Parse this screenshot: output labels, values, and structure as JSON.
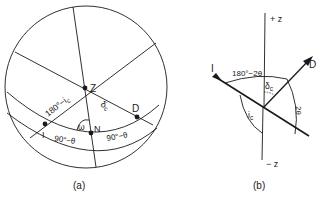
{
  "panel_a": {
    "caption": "(a)",
    "points": {
      "Z": "Z",
      "D": "D",
      "N": "N",
      "I": "I"
    },
    "labels": {
      "arc_IZ": "180°−i",
      "arc_IZ_sub": "c",
      "arc_ZD": "δ",
      "arc_ZD_sub": "c",
      "angle_N": "ω",
      "arc_IN": "90°−θ",
      "arc_ND": "90°−θ"
    }
  },
  "panel_b": {
    "caption": "(b)",
    "axis_top": "+ z",
    "axis_bottom": "− z",
    "ray_incident": "I",
    "ray_diffracted": "D",
    "labels": {
      "angle_top": "180°−2θ",
      "delta": "δ",
      "delta_sub": "c",
      "ic": "i",
      "ic_sub": "c",
      "two_theta": "2θ"
    }
  },
  "colors": {
    "stroke": "#1a1a1a",
    "background": "#ffffff"
  }
}
